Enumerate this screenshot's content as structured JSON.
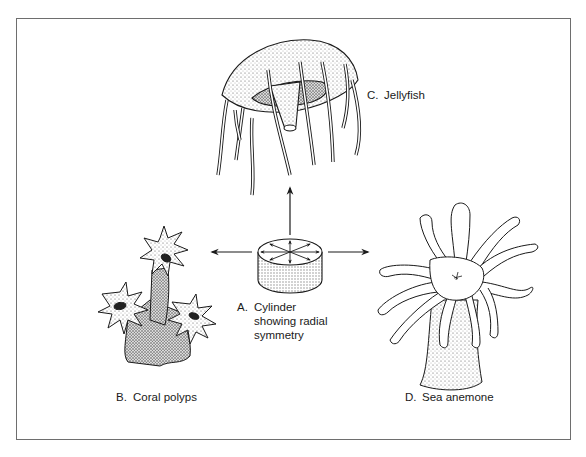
{
  "figure": {
    "center": {
      "letter": "A.",
      "line1": "Cylinder",
      "line2": "showing radial",
      "line3": "symmetry"
    },
    "organisms": [
      {
        "letter": "B.",
        "name": "Coral polyps",
        "position": "left"
      },
      {
        "letter": "C.",
        "name": "Jellyfish",
        "position": "top"
      },
      {
        "letter": "D.",
        "name": "Sea anemone",
        "position": "right"
      }
    ],
    "arrows": [
      "up",
      "left",
      "right"
    ],
    "colors": {
      "ink": "#1a1a1a",
      "border": "#6e6e6e",
      "stipple": "#9a9a9a",
      "background": "#ffffff"
    }
  }
}
